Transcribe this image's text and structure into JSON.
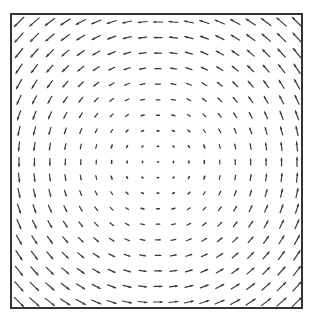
{
  "chart_data": {
    "type": "quiver",
    "title": "",
    "xlabel": "",
    "ylabel": "",
    "grid": {
      "cols": 19,
      "rows": 19
    },
    "frame": {
      "left": 11,
      "top": 14,
      "right": 302,
      "bottom": 308
    },
    "center": {
      "x": 158,
      "y": 163
    },
    "rotation": "counter-clockwise",
    "magnitude_model": "proportional to distance from center",
    "max_arrow_length_px": 14,
    "ticks": false,
    "grid_lines": false,
    "legend": null,
    "colors": {
      "arrow": "#3a3a3a",
      "frame": "#333333",
      "background": "#ffffff"
    }
  },
  "caption": ""
}
